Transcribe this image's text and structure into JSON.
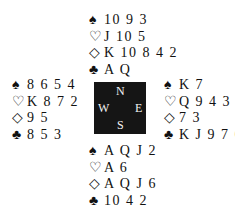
{
  "suits": {
    "spades": "♠",
    "hearts": "♡",
    "diamonds": "◇",
    "clubs": "♣"
  },
  "compass": {
    "north": "N",
    "south": "S",
    "west": "W",
    "east": "E"
  },
  "hands": {
    "north": {
      "spades": "10 9 3",
      "hearts": "J 10 5",
      "diamonds": "K 10 8 4 2",
      "clubs": "A Q"
    },
    "west": {
      "spades": "8 6 5 4",
      "hearts": "K 8 7 2",
      "diamonds": "9 5",
      "clubs": "8 5 3"
    },
    "east": {
      "spades": "K 7",
      "hearts": "Q 9 4 3",
      "diamonds": "7 3",
      "clubs": "K J 9 7 6"
    },
    "south": {
      "spades": "A Q J 2",
      "hearts": "A 6",
      "diamonds": "A Q J 6",
      "clubs": "10 4 2"
    }
  }
}
